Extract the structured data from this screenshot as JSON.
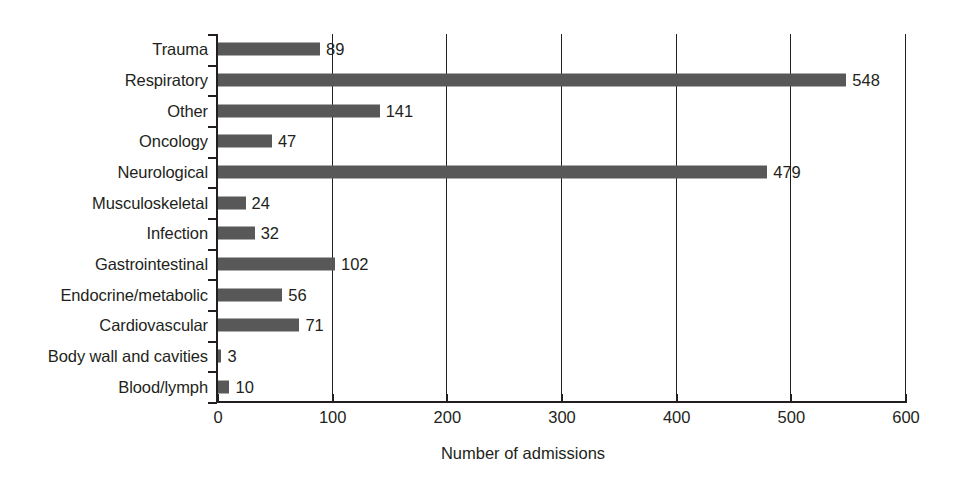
{
  "chart_data": {
    "type": "bar",
    "orientation": "horizontal",
    "title": "",
    "xlabel": "Number of admissions",
    "ylabel": "",
    "xlim": [
      0,
      600
    ],
    "xticks": [
      0,
      100,
      200,
      300,
      400,
      500,
      600
    ],
    "grid": "vertical",
    "legend": "none",
    "bar_color": "#585858",
    "axis_color": "#231f20",
    "categories": [
      "Trauma",
      "Respiratory",
      "Other",
      "Oncology",
      "Neurological",
      "Musculoskeletal",
      "Infection",
      "Gastrointestinal",
      "Endocrine/metabolic",
      "Cardiovascular",
      "Body wall and cavities",
      "Blood/lymph"
    ],
    "values": [
      89,
      548,
      141,
      47,
      479,
      24,
      32,
      102,
      56,
      71,
      3,
      10
    ],
    "value_labels": [
      "89",
      "548",
      "141",
      "47",
      "479",
      "24",
      "32",
      "102",
      "56",
      "71",
      "3",
      "10"
    ]
  }
}
